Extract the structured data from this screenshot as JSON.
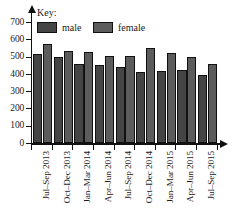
{
  "chart_data": {
    "type": "bar",
    "title": "",
    "xlabel": "",
    "ylabel": "",
    "ylim": [
      0,
      700
    ],
    "grid": false,
    "legend_position": "top-left",
    "legend_title": "Key:",
    "categories": [
      "Jul–Sep 2013",
      "Oct–Dec 2013",
      "Jan–Mar 2014",
      "Apr–Jun 2014",
      "Jul–Sep 2014",
      "Oct–Dec 2014",
      "Jan–Mar 2015",
      "Apr–Jun 2015",
      "Jul–Sep 2015"
    ],
    "series": [
      {
        "name": "male",
        "color": "#454545",
        "values": [
          520,
          500,
          460,
          455,
          445,
          415,
          420,
          425,
          395
        ]
      },
      {
        "name": "female",
        "color": "#5c5c5c",
        "values": [
          575,
          538,
          527,
          507,
          507,
          550,
          523,
          500,
          458
        ]
      }
    ],
    "y_ticks": [
      0,
      100,
      200,
      300,
      400,
      500,
      600,
      700
    ],
    "y_tick_labels": [
      "0",
      "100",
      "200",
      "300",
      "400",
      "500",
      "600",
      "700"
    ]
  },
  "axes": {
    "baseline_y_px": 143.4,
    "plot_left_px": 31,
    "units_per_px": 7.463
  }
}
